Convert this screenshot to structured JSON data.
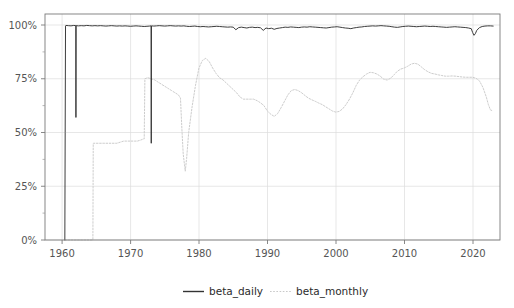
{
  "chart_data": {
    "type": "line",
    "title": "",
    "subtitle": "",
    "xlabel": "",
    "ylabel": "",
    "xlim": [
      1957.5,
      2024.0
    ],
    "ylim": [
      0,
      1.04
    ],
    "grid": true,
    "legend_position": "bottom",
    "x_ticks": [
      "1960",
      "1970",
      "1980",
      "1990",
      "2000",
      "2010",
      "2020"
    ],
    "x_tick_values": [
      1960,
      1970,
      1980,
      1990,
      2000,
      2010,
      2020
    ],
    "y_ticks": [
      "0%",
      "25%",
      "50%",
      "75%",
      "100%"
    ],
    "y_tick_values": [
      0,
      0.25,
      0.5,
      0.75,
      1.0
    ],
    "y_minor_tick_values": [
      0.125,
      0.375,
      0.625,
      0.875
    ],
    "series": [
      {
        "name": "beta_daily",
        "color": "#333333",
        "style": "solid",
        "x": [
          1960.4,
          1960.45,
          1960.5,
          1960.55,
          1960.9,
          1961.3,
          1961.7,
          1962.0,
          1962.02,
          1962.05,
          1962.4,
          1962.8,
          1963.2,
          1963.6,
          1964.0,
          1964.4,
          1964.8,
          1965.2,
          1965.6,
          1966.0,
          1966.4,
          1966.8,
          1967.2,
          1967.6,
          1968.0,
          1968.4,
          1968.8,
          1969.2,
          1969.6,
          1970.0,
          1970.4,
          1970.8,
          1971.2,
          1971.6,
          1972.0,
          1972.4,
          1972.8,
          1973.0,
          1973.03,
          1973.06,
          1973.4,
          1973.8,
          1974.2,
          1974.6,
          1975.0,
          1975.4,
          1975.8,
          1976.2,
          1976.6,
          1977.0,
          1977.4,
          1977.8,
          1978.2,
          1978.6,
          1979.0,
          1979.4,
          1979.8,
          1980.2,
          1980.6,
          1981.0,
          1981.4,
          1981.8,
          1982.2,
          1982.6,
          1983.0,
          1983.4,
          1983.8,
          1984.2,
          1984.6,
          1985.0,
          1985.4,
          1985.8,
          1986.2,
          1986.6,
          1987.0,
          1987.4,
          1987.8,
          1988.2,
          1988.6,
          1989.0,
          1989.4,
          1989.8,
          1990.2,
          1990.6,
          1991.0,
          1991.4,
          1991.8,
          1992.2,
          1992.6,
          1993.0,
          1993.4,
          1993.8,
          1994.2,
          1994.6,
          1995.0,
          1995.4,
          1995.8,
          1996.2,
          1996.6,
          1997.0,
          1997.4,
          1997.8,
          1998.2,
          1998.6,
          1999.0,
          1999.4,
          1999.8,
          2000.2,
          2000.6,
          2001.0,
          2001.4,
          2001.8,
          2002.2,
          2002.6,
          2003.0,
          2003.4,
          2003.8,
          2004.2,
          2004.6,
          2005.0,
          2005.4,
          2005.8,
          2006.2,
          2006.6,
          2007.0,
          2007.4,
          2007.8,
          2008.2,
          2008.6,
          2009.0,
          2009.4,
          2009.8,
          2010.2,
          2010.6,
          2011.0,
          2011.4,
          2011.8,
          2012.2,
          2012.6,
          2013.0,
          2013.4,
          2013.8,
          2014.2,
          2014.6,
          2015.0,
          2015.4,
          2015.8,
          2016.2,
          2016.6,
          2017.0,
          2017.4,
          2017.8,
          2018.2,
          2018.6,
          2019.0,
          2019.4,
          2019.8,
          2020.0,
          2020.2,
          2020.4,
          2020.6,
          2021.0,
          2021.4,
          2021.8,
          2022.2,
          2022.6,
          2023.0
        ],
        "y": [
          0.0,
          0.5,
          0.995,
          0.998,
          0.997,
          0.996,
          0.998,
          0.997,
          0.57,
          0.997,
          0.996,
          0.997,
          0.996,
          0.998,
          0.997,
          0.996,
          0.997,
          0.996,
          0.997,
          0.996,
          0.995,
          0.996,
          0.997,
          0.996,
          0.995,
          0.996,
          0.995,
          0.996,
          0.995,
          0.994,
          0.995,
          0.996,
          0.995,
          0.994,
          0.993,
          0.994,
          0.995,
          0.996,
          0.45,
          0.996,
          0.995,
          0.996,
          0.997,
          0.996,
          0.995,
          0.996,
          0.997,
          0.996,
          0.995,
          0.996,
          0.995,
          0.996,
          0.994,
          0.993,
          0.994,
          0.995,
          0.993,
          0.992,
          0.993,
          0.992,
          0.991,
          0.992,
          0.993,
          0.994,
          0.993,
          0.992,
          0.991,
          0.99,
          0.991,
          0.99,
          0.978,
          0.988,
          0.99,
          0.988,
          0.986,
          0.989,
          0.99,
          0.988,
          0.989,
          0.987,
          0.975,
          0.986,
          0.983,
          0.985,
          0.98,
          0.984,
          0.986,
          0.988,
          0.99,
          0.989,
          0.991,
          0.99,
          0.989,
          0.988,
          0.99,
          0.991,
          0.99,
          0.992,
          0.991,
          0.99,
          0.989,
          0.988,
          0.987,
          0.986,
          0.988,
          0.99,
          0.991,
          0.992,
          0.99,
          0.988,
          0.986,
          0.985,
          0.983,
          0.986,
          0.988,
          0.99,
          0.991,
          0.993,
          0.994,
          0.995,
          0.996,
          0.995,
          0.996,
          0.997,
          0.996,
          0.995,
          0.994,
          0.992,
          0.99,
          0.989,
          0.991,
          0.993,
          0.994,
          0.995,
          0.994,
          0.993,
          0.992,
          0.993,
          0.994,
          0.995,
          0.994,
          0.993,
          0.994,
          0.993,
          0.992,
          0.991,
          0.99,
          0.989,
          0.99,
          0.991,
          0.992,
          0.991,
          0.99,
          0.989,
          0.988,
          0.986,
          0.983,
          0.965,
          0.952,
          0.96,
          0.975,
          0.988,
          0.993,
          0.995,
          0.996,
          0.996,
          0.995
        ]
      },
      {
        "name": "beta_monthly",
        "color": "#c9c9c9",
        "style": "dotted",
        "x": [
          1960.4,
          1961.0,
          1962.0,
          1963.0,
          1964.0,
          1964.4,
          1964.5,
          1964.55,
          1965.0,
          1966.0,
          1967.0,
          1968.0,
          1968.5,
          1969.0,
          1970.0,
          1971.0,
          1971.5,
          1971.9,
          1972.0,
          1972.1,
          1972.5,
          1973.0,
          1973.5,
          1974.0,
          1974.5,
          1975.0,
          1975.5,
          1976.0,
          1976.5,
          1977.0,
          1977.3,
          1977.5,
          1977.7,
          1978.0,
          1978.2,
          1978.5,
          1979.0,
          1979.5,
          1980.0,
          1980.5,
          1981.0,
          1981.5,
          1982.0,
          1982.5,
          1983.0,
          1983.5,
          1984.0,
          1984.5,
          1985.0,
          1985.5,
          1986.0,
          1986.5,
          1987.0,
          1987.5,
          1988.0,
          1988.5,
          1989.0,
          1989.5,
          1990.0,
          1990.5,
          1991.0,
          1991.5,
          1992.0,
          1992.5,
          1993.0,
          1993.5,
          1994.0,
          1994.5,
          1995.0,
          1995.5,
          1996.0,
          1996.5,
          1997.0,
          1997.5,
          1998.0,
          1998.5,
          1999.0,
          1999.5,
          2000.0,
          2000.5,
          2001.0,
          2001.5,
          2002.0,
          2002.5,
          2003.0,
          2003.5,
          2004.0,
          2004.5,
          2005.0,
          2005.5,
          2006.0,
          2006.5,
          2007.0,
          2007.5,
          2008.0,
          2008.5,
          2009.0,
          2009.5,
          2010.0,
          2010.5,
          2011.0,
          2011.5,
          2012.0,
          2012.5,
          2013.0,
          2013.5,
          2014.0,
          2014.5,
          2015.0,
          2015.5,
          2016.0,
          2016.5,
          2017.0,
          2017.5,
          2018.0,
          2018.5,
          2019.0,
          2019.5,
          2020.0,
          2020.5,
          2021.0,
          2021.5,
          2022.0,
          2022.3,
          2022.6,
          2023.0
        ],
        "y": [
          0.0,
          0.0,
          0.0,
          0.0,
          0.0,
          0.0,
          0.0,
          0.45,
          0.45,
          0.45,
          0.45,
          0.45,
          0.455,
          0.46,
          0.46,
          0.46,
          0.465,
          0.47,
          0.47,
          0.75,
          0.755,
          0.75,
          0.745,
          0.735,
          0.725,
          0.715,
          0.705,
          0.695,
          0.685,
          0.675,
          0.66,
          0.52,
          0.4,
          0.32,
          0.38,
          0.5,
          0.62,
          0.72,
          0.8,
          0.835,
          0.845,
          0.83,
          0.8,
          0.775,
          0.755,
          0.745,
          0.73,
          0.715,
          0.7,
          0.685,
          0.665,
          0.655,
          0.655,
          0.655,
          0.655,
          0.648,
          0.638,
          0.625,
          0.6,
          0.585,
          0.575,
          0.588,
          0.615,
          0.645,
          0.675,
          0.695,
          0.7,
          0.695,
          0.685,
          0.672,
          0.66,
          0.652,
          0.645,
          0.637,
          0.63,
          0.62,
          0.61,
          0.6,
          0.595,
          0.598,
          0.61,
          0.63,
          0.655,
          0.685,
          0.72,
          0.745,
          0.76,
          0.772,
          0.78,
          0.778,
          0.772,
          0.762,
          0.748,
          0.744,
          0.752,
          0.768,
          0.785,
          0.795,
          0.8,
          0.808,
          0.818,
          0.822,
          0.818,
          0.805,
          0.792,
          0.782,
          0.775,
          0.772,
          0.768,
          0.765,
          0.762,
          0.762,
          0.763,
          0.762,
          0.76,
          0.758,
          0.757,
          0.757,
          0.757,
          0.752,
          0.74,
          0.71,
          0.665,
          0.63,
          0.605,
          0.6
        ]
      }
    ],
    "legend": [
      {
        "label": "beta_daily",
        "color": "#333333",
        "style": "solid"
      },
      {
        "label": "beta_monthly",
        "color": "#c9c9c9",
        "style": "dotted"
      }
    ]
  },
  "axes": {
    "y_label_0": "0%",
    "y_label_25": "25%",
    "y_label_50": "50%",
    "y_label_75": "75%",
    "y_label_100": "100%",
    "x_label_1960": "1960",
    "x_label_1970": "1970",
    "x_label_1980": "1980",
    "x_label_1990": "1990",
    "x_label_2000": "2000",
    "x_label_2010": "2010",
    "x_label_2020": "2020"
  },
  "legend": {
    "daily_label": "beta_daily",
    "monthly_label": "beta_monthly"
  },
  "colors": {
    "background": "#ffffff",
    "grid": "#dcdcdc",
    "frame": "#7a7a7a",
    "daily": "#333333",
    "monthly": "#c9c9c9",
    "text": "#555555"
  }
}
